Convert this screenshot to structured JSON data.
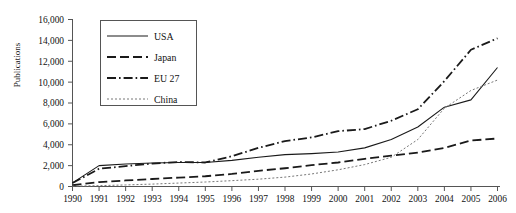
{
  "chart_data": {
    "type": "line",
    "title": "",
    "xlabel": "",
    "ylabel": "Publications",
    "x": [
      1990,
      1991,
      1992,
      1993,
      1994,
      1995,
      1996,
      1997,
      1998,
      1999,
      2000,
      2001,
      2002,
      2003,
      2004,
      2005,
      2006
    ],
    "xticklabels": [
      "1990",
      "1991",
      "1992",
      "1993",
      "1994",
      "1995",
      "1996",
      "1997",
      "1998",
      "1999",
      "2000",
      "2001",
      "2002",
      "2003",
      "2004",
      "2005",
      "2006"
    ],
    "yticklabels": [
      "0",
      "2,000",
      "4,000",
      "6,000",
      "8,000",
      "10,000",
      "12,000",
      "14,000",
      "16,000"
    ],
    "yticks": [
      0,
      2000,
      4000,
      6000,
      8000,
      10000,
      12000,
      14000,
      16000
    ],
    "xlim": [
      1990,
      2006
    ],
    "ylim": [
      0,
      16000
    ],
    "grid": false,
    "legend_position": "upper-left-inside",
    "series": [
      {
        "name": "USA",
        "style": "solid",
        "color": "#1a1a1a",
        "values": [
          350,
          2000,
          2150,
          2250,
          2300,
          2300,
          2500,
          2800,
          3050,
          3150,
          3300,
          3700,
          4500,
          5700,
          7600,
          8300,
          11400
        ]
      },
      {
        "name": "Japan",
        "style": "dashed",
        "color": "#1a1a1a",
        "values": [
          120,
          420,
          580,
          720,
          850,
          980,
          1200,
          1500,
          1750,
          2050,
          2300,
          2650,
          2950,
          3250,
          3700,
          4400,
          4600
        ]
      },
      {
        "name": "EU 27",
        "style": "dash-dot",
        "color": "#1a1a1a",
        "values": [
          330,
          1700,
          1950,
          2200,
          2350,
          2300,
          2900,
          3700,
          4350,
          4700,
          5300,
          5500,
          6300,
          7400,
          10100,
          13100,
          14200
        ]
      },
      {
        "name": "China",
        "style": "dotted",
        "color": "#777777",
        "values": [
          40,
          80,
          150,
          230,
          330,
          430,
          560,
          700,
          900,
          1200,
          1600,
          2100,
          2800,
          4500,
          7500,
          9200,
          10200
        ]
      }
    ]
  },
  "legend": {
    "entries": [
      "USA",
      "Japan",
      "EU 27",
      "China"
    ]
  },
  "axes": {
    "y_axis_title": "Publications"
  }
}
